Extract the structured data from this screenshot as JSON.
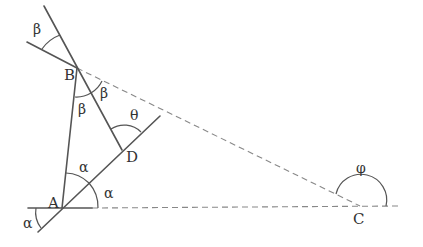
{
  "diagram": {
    "type": "geometry",
    "colors": {
      "line": "#555555",
      "dashed": "#888888",
      "text": "#333333",
      "background": "#ffffff"
    },
    "points": {
      "A": {
        "label": "A",
        "x": 62,
        "y": 208
      },
      "B": {
        "label": "B",
        "x": 77,
        "y": 68
      },
      "C": {
        "label": "C",
        "x": 360,
        "y": 206
      },
      "D": {
        "label": "D",
        "x": 122,
        "y": 150
      }
    },
    "angles": {
      "alpha_bottom_left": "α",
      "alpha_at_A_inner": "α",
      "alpha_at_A_right": "α",
      "beta_top": "β",
      "beta_at_B_inner": "β",
      "beta_at_B_right": "β",
      "theta_at_D": "θ",
      "phi_at_C": "φ"
    },
    "segments": [
      {
        "from": "A",
        "to": "B",
        "style": "solid"
      },
      {
        "from": "A",
        "to": "D",
        "style": "solid",
        "extended": true
      },
      {
        "from": "B",
        "to": "D",
        "style": "solid",
        "extended": true
      },
      {
        "from": "B",
        "to": "C",
        "style": "dashed"
      },
      {
        "from": "A",
        "to": "C",
        "style": "dashed",
        "extended": true
      }
    ]
  }
}
